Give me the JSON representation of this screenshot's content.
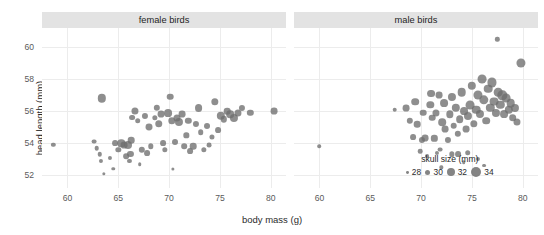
{
  "chart_data": {
    "type": "scatter",
    "title": "",
    "xlabel": "body mass (g)",
    "ylabel": "head length (mm)",
    "xlim": [
      57.5,
      81.5
    ],
    "ylim": [
      51.2,
      61.2
    ],
    "xticks": [
      60,
      65,
      70,
      75,
      80
    ],
    "yticks": [
      52,
      54,
      56,
      58,
      60
    ],
    "grid": true,
    "size_legend": {
      "title": "skull size (mm)",
      "values": [
        28,
        30,
        32,
        34
      ],
      "position": "inside-bottom-right"
    },
    "facets": [
      {
        "label": "female birds",
        "points": [
          {
            "x": 58.6,
            "y": 53.9,
            "s": 29.2
          },
          {
            "x": 63.4,
            "y": 56.8,
            "s": 32.4
          },
          {
            "x": 62.6,
            "y": 54.1,
            "s": 29.6
          },
          {
            "x": 62.9,
            "y": 53.7,
            "s": 29.4
          },
          {
            "x": 63.3,
            "y": 52.9,
            "s": 29.0
          },
          {
            "x": 63.2,
            "y": 53.3,
            "s": 29.3
          },
          {
            "x": 63.6,
            "y": 52.1,
            "s": 28.4
          },
          {
            "x": 64.7,
            "y": 54.0,
            "s": 30.4
          },
          {
            "x": 65.0,
            "y": 53.6,
            "s": 30.0
          },
          {
            "x": 65.3,
            "y": 54.0,
            "s": 31.6
          },
          {
            "x": 65.6,
            "y": 53.9,
            "s": 31.2
          },
          {
            "x": 65.8,
            "y": 53.2,
            "s": 30.3
          },
          {
            "x": 66.0,
            "y": 53.9,
            "s": 32.1
          },
          {
            "x": 66.2,
            "y": 53.3,
            "s": 30.6
          },
          {
            "x": 66.3,
            "y": 54.2,
            "s": 31.0
          },
          {
            "x": 66.6,
            "y": 56.0,
            "s": 31.4
          },
          {
            "x": 66.4,
            "y": 55.6,
            "s": 30.4
          },
          {
            "x": 66.9,
            "y": 55.4,
            "s": 30.2
          },
          {
            "x": 67.3,
            "y": 53.6,
            "s": 30.8
          },
          {
            "x": 67.6,
            "y": 55.7,
            "s": 30.6
          },
          {
            "x": 67.8,
            "y": 53.4,
            "s": 30.4
          },
          {
            "x": 68.0,
            "y": 55.0,
            "s": 31.3
          },
          {
            "x": 68.2,
            "y": 53.8,
            "s": 30.1
          },
          {
            "x": 68.6,
            "y": 55.6,
            "s": 30.0
          },
          {
            "x": 68.8,
            "y": 56.2,
            "s": 30.8
          },
          {
            "x": 69.0,
            "y": 55.2,
            "s": 31.7
          },
          {
            "x": 69.2,
            "y": 55.8,
            "s": 31.2
          },
          {
            "x": 69.4,
            "y": 54.0,
            "s": 30.4
          },
          {
            "x": 69.6,
            "y": 53.6,
            "s": 30.0
          },
          {
            "x": 69.9,
            "y": 55.9,
            "s": 32.0
          },
          {
            "x": 70.1,
            "y": 56.9,
            "s": 31.0
          },
          {
            "x": 70.3,
            "y": 55.4,
            "s": 31.6
          },
          {
            "x": 70.6,
            "y": 54.1,
            "s": 30.5
          },
          {
            "x": 70.8,
            "y": 55.6,
            "s": 31.4
          },
          {
            "x": 71.0,
            "y": 55.3,
            "s": 32.2
          },
          {
            "x": 71.3,
            "y": 55.8,
            "s": 31.2
          },
          {
            "x": 71.5,
            "y": 53.8,
            "s": 30.2
          },
          {
            "x": 71.7,
            "y": 54.5,
            "s": 30.0
          },
          {
            "x": 71.9,
            "y": 55.4,
            "s": 30.8
          },
          {
            "x": 72.1,
            "y": 53.5,
            "s": 30.4
          },
          {
            "x": 72.4,
            "y": 53.8,
            "s": 31.0
          },
          {
            "x": 72.6,
            "y": 55.2,
            "s": 30.6
          },
          {
            "x": 72.9,
            "y": 56.2,
            "s": 32.0
          },
          {
            "x": 73.1,
            "y": 54.7,
            "s": 30.2
          },
          {
            "x": 73.4,
            "y": 53.6,
            "s": 30.0
          },
          {
            "x": 73.7,
            "y": 55.1,
            "s": 30.5
          },
          {
            "x": 73.9,
            "y": 53.9,
            "s": 29.6
          },
          {
            "x": 74.2,
            "y": 54.4,
            "s": 29.8
          },
          {
            "x": 74.5,
            "y": 56.6,
            "s": 31.6
          },
          {
            "x": 74.8,
            "y": 54.8,
            "s": 30.4
          },
          {
            "x": 75.1,
            "y": 55.7,
            "s": 32.4
          },
          {
            "x": 75.4,
            "y": 55.5,
            "s": 30.8
          },
          {
            "x": 75.7,
            "y": 56.0,
            "s": 31.0
          },
          {
            "x": 76.0,
            "y": 55.8,
            "s": 31.8
          },
          {
            "x": 76.4,
            "y": 55.6,
            "s": 32.2
          },
          {
            "x": 76.8,
            "y": 55.9,
            "s": 31.4
          },
          {
            "x": 77.2,
            "y": 56.2,
            "s": 30.6
          },
          {
            "x": 78.0,
            "y": 55.9,
            "s": 30.8
          },
          {
            "x": 80.3,
            "y": 56.0,
            "s": 31.2
          },
          {
            "x": 66.1,
            "y": 52.9,
            "s": 29.0
          },
          {
            "x": 67.1,
            "y": 52.7,
            "s": 28.6
          },
          {
            "x": 64.2,
            "y": 53.1,
            "s": 29.0
          },
          {
            "x": 64.5,
            "y": 52.4,
            "s": 28.5
          },
          {
            "x": 70.4,
            "y": 52.4,
            "s": 28.3
          }
        ]
      },
      {
        "label": "male birds",
        "points": [
          {
            "x": 60.0,
            "y": 53.8,
            "s": 28.6
          },
          {
            "x": 67.4,
            "y": 56.1,
            "s": 29.4
          },
          {
            "x": 68.5,
            "y": 56.2,
            "s": 31.2
          },
          {
            "x": 69.4,
            "y": 56.6,
            "s": 31.8
          },
          {
            "x": 69.6,
            "y": 55.2,
            "s": 31.0
          },
          {
            "x": 69.2,
            "y": 54.4,
            "s": 30.4
          },
          {
            "x": 70.1,
            "y": 54.2,
            "s": 30.6
          },
          {
            "x": 70.4,
            "y": 54.3,
            "s": 31.2
          },
          {
            "x": 70.9,
            "y": 56.4,
            "s": 31.6
          },
          {
            "x": 71.1,
            "y": 55.6,
            "s": 31.0
          },
          {
            "x": 71.3,
            "y": 54.3,
            "s": 30.8
          },
          {
            "x": 71.5,
            "y": 55.9,
            "s": 31.4
          },
          {
            "x": 71.0,
            "y": 57.1,
            "s": 32.0
          },
          {
            "x": 71.8,
            "y": 57.0,
            "s": 31.2
          },
          {
            "x": 71.6,
            "y": 53.4,
            "s": 29.0
          },
          {
            "x": 72.1,
            "y": 55.3,
            "s": 31.8
          },
          {
            "x": 72.3,
            "y": 56.5,
            "s": 32.0
          },
          {
            "x": 72.4,
            "y": 54.9,
            "s": 31.2
          },
          {
            "x": 72.6,
            "y": 54.2,
            "s": 30.6
          },
          {
            "x": 72.8,
            "y": 55.8,
            "s": 31.6
          },
          {
            "x": 73.0,
            "y": 56.9,
            "s": 32.2
          },
          {
            "x": 73.2,
            "y": 55.1,
            "s": 31.0
          },
          {
            "x": 73.4,
            "y": 56.2,
            "s": 32.4
          },
          {
            "x": 73.6,
            "y": 54.6,
            "s": 30.8
          },
          {
            "x": 73.8,
            "y": 55.5,
            "s": 31.8
          },
          {
            "x": 74.0,
            "y": 57.2,
            "s": 32.6
          },
          {
            "x": 74.2,
            "y": 56.0,
            "s": 32.0
          },
          {
            "x": 74.4,
            "y": 54.9,
            "s": 31.2
          },
          {
            "x": 74.6,
            "y": 55.7,
            "s": 32.2
          },
          {
            "x": 74.8,
            "y": 56.4,
            "s": 32.8
          },
          {
            "x": 75.0,
            "y": 57.6,
            "s": 32.4
          },
          {
            "x": 75.2,
            "y": 55.2,
            "s": 31.6
          },
          {
            "x": 75.4,
            "y": 56.1,
            "s": 32.6
          },
          {
            "x": 75.6,
            "y": 57.0,
            "s": 33.0
          },
          {
            "x": 75.8,
            "y": 55.8,
            "s": 32.2
          },
          {
            "x": 76.0,
            "y": 58.0,
            "s": 32.8
          },
          {
            "x": 76.2,
            "y": 56.7,
            "s": 33.2
          },
          {
            "x": 76.4,
            "y": 55.4,
            "s": 31.8
          },
          {
            "x": 76.6,
            "y": 57.4,
            "s": 32.6
          },
          {
            "x": 76.8,
            "y": 56.2,
            "s": 32.4
          },
          {
            "x": 77.0,
            "y": 57.8,
            "s": 33.0
          },
          {
            "x": 77.2,
            "y": 56.6,
            "s": 32.8
          },
          {
            "x": 77.4,
            "y": 55.9,
            "s": 32.2
          },
          {
            "x": 77.5,
            "y": 60.5,
            "s": 29.2
          },
          {
            "x": 77.6,
            "y": 57.2,
            "s": 32.6
          },
          {
            "x": 77.8,
            "y": 56.4,
            "s": 32.4
          },
          {
            "x": 78.0,
            "y": 57.0,
            "s": 33.2
          },
          {
            "x": 78.2,
            "y": 55.8,
            "s": 32.0
          },
          {
            "x": 78.4,
            "y": 56.8,
            "s": 32.8
          },
          {
            "x": 78.6,
            "y": 56.1,
            "s": 32.4
          },
          {
            "x": 78.8,
            "y": 56.5,
            "s": 32.6
          },
          {
            "x": 79.0,
            "y": 55.6,
            "s": 31.8
          },
          {
            "x": 79.2,
            "y": 56.2,
            "s": 32.2
          },
          {
            "x": 79.4,
            "y": 55.3,
            "s": 31.4
          },
          {
            "x": 79.8,
            "y": 59.0,
            "s": 33.0
          },
          {
            "x": 70.6,
            "y": 53.2,
            "s": 28.8
          },
          {
            "x": 73.0,
            "y": 53.3,
            "s": 30.0
          },
          {
            "x": 73.6,
            "y": 53.3,
            "s": 30.4
          },
          {
            "x": 74.6,
            "y": 53.4,
            "s": 30.2
          },
          {
            "x": 71.9,
            "y": 53.6,
            "s": 29.6
          },
          {
            "x": 69.9,
            "y": 53.5,
            "s": 29.4
          },
          {
            "x": 75.6,
            "y": 53.0,
            "s": 29.0
          },
          {
            "x": 76.2,
            "y": 52.6,
            "s": 28.8
          },
          {
            "x": 74.2,
            "y": 52.8,
            "s": 28.6
          },
          {
            "x": 68.9,
            "y": 55.4,
            "s": 30.8
          },
          {
            "x": 70.2,
            "y": 55.9,
            "s": 31.0
          },
          {
            "x": 72.0,
            "y": 52.5,
            "s": 28.4
          }
        ]
      }
    ]
  }
}
